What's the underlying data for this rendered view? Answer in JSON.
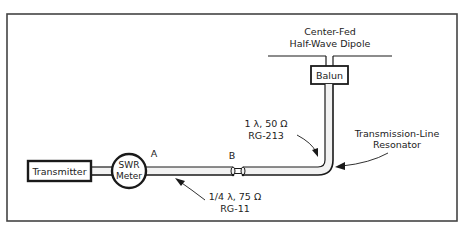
{
  "diagram": {
    "type": "transmission-line-schematic",
    "components": {
      "transmitter": {
        "label": "Transmitter"
      },
      "swr_meter": {
        "label_line1": "SWR",
        "label_line2": "Meter"
      },
      "balun": {
        "label": "Balun"
      },
      "dipole": {
        "label_line1": "Center-Fed",
        "label_line2": "Half-Wave Dipole"
      }
    },
    "points": {
      "a": {
        "label": "A"
      },
      "b": {
        "label": "B"
      }
    },
    "annotations": {
      "quarter_wave": {
        "line1": "1/4 λ, 75 Ω",
        "line2": "RG-11"
      },
      "one_wave": {
        "line1": "1 λ, 50 Ω",
        "line2": "RG-213"
      },
      "resonator": {
        "line1": "Transmission-Line",
        "line2": "Resonator"
      }
    },
    "colors": {
      "line": "#1a1a1a",
      "cable_fill": "#f2f2f2",
      "background": "#ffffff"
    }
  }
}
